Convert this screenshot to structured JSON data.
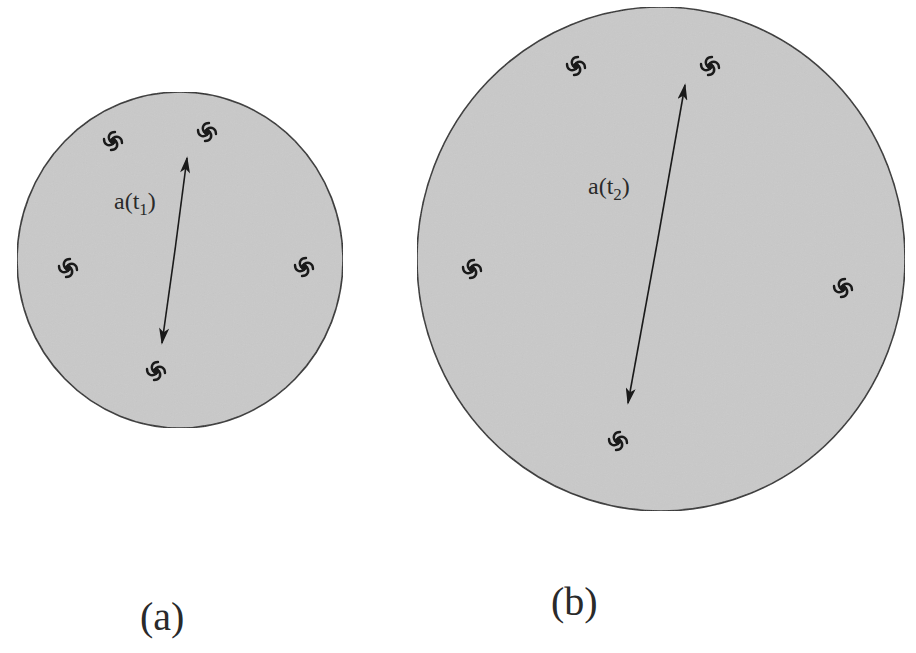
{
  "colors": {
    "background": "#ffffff",
    "universe_fill": "#c9c9c9",
    "outline": "#333333",
    "ink": "#1a1a1a"
  },
  "panels": [
    {
      "id": "a",
      "caption": "(a)",
      "scale_label": {
        "base": "a(t",
        "sub": "1",
        "close": ")"
      },
      "galaxy_count": 5
    },
    {
      "id": "b",
      "caption": "(b)",
      "scale_label": {
        "base": "a(t",
        "sub": "2",
        "close": ")"
      },
      "galaxy_count": 5
    }
  ]
}
